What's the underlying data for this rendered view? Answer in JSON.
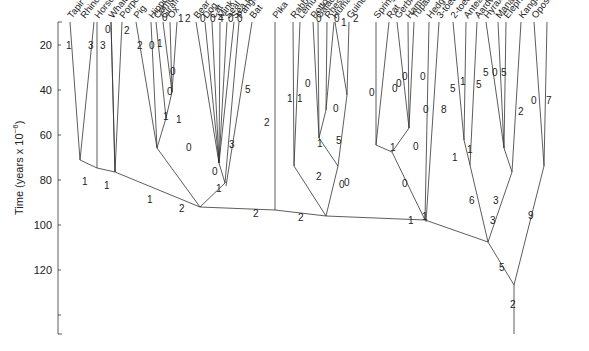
{
  "chart_data": {
    "type": "tree",
    "title": "",
    "ylabel": "Time (years x 10^-6)",
    "ylabel_main": "Time (years x 10",
    "ylabel_exp": "−6",
    "ylabel_close": ")",
    "yticks": [
      20,
      40,
      60,
      80,
      100,
      120
    ],
    "ylim": [
      0,
      120
    ],
    "leaves": [
      "Tapir",
      "Rhinoceros",
      "Horse",
      "Whale",
      "Porpoise",
      "Pig",
      "Hippopotamus",
      "Camel",
      "Giraffe",
      "Ox",
      "Bear",
      "Dog",
      "Cat",
      "Mink",
      "Seal",
      "Sea lion",
      "Pangolin",
      "Bat",
      "Pika",
      "Rabbit",
      "Lemur",
      "Potto",
      "Galaco",
      "Rhesus monkey",
      "Human",
      "Guinea pig",
      "Springhaas",
      "Rat",
      "Gerbil",
      "Hamster",
      "Tupaia",
      "Hedgehog",
      "3-toed sloth",
      "2-toed sloth",
      "Anteater",
      "Aardvark",
      "Hyrax",
      "Manatee",
      "Elephant",
      "Kangaroo",
      "Opossum"
    ],
    "leaf_branch_labels": [
      "1",
      "3",
      "3",
      "0",
      "2",
      "2",
      "0",
      "1",
      "0",
      "1",
      "2",
      "0",
      "0",
      "4",
      "0",
      "0",
      "5",
      "2",
      "1",
      "1",
      "0",
      "0",
      "0",
      "1",
      "2",
      "0",
      "0",
      "0",
      "0",
      "0",
      "8",
      "5",
      "1",
      "5",
      "5",
      "0",
      "5",
      "2",
      "0",
      "7"
    ],
    "internal_branch_labels": [
      "1",
      "1",
      "0",
      "1",
      "0",
      "0",
      "1",
      "0",
      "1",
      "3",
      "0",
      "1",
      "2",
      "2",
      "0",
      "2",
      "5",
      "0",
      "0",
      "1",
      "1",
      "0",
      "0",
      "0",
      "1",
      "1",
      "6",
      "3",
      "3",
      "9",
      "5",
      "2"
    ]
  }
}
